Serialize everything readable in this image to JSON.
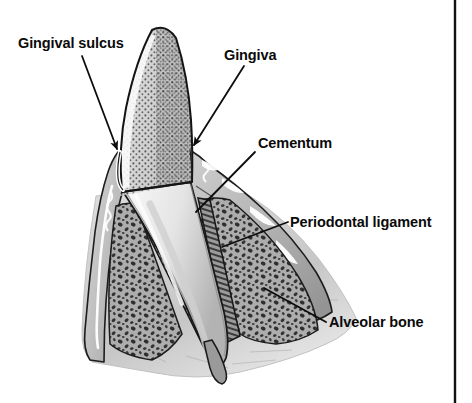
{
  "figure": {
    "kind": "anatomical-illustration",
    "style": "black-and-white line drawing with halftone shading",
    "background_color": "#ffffff",
    "line_color": "#111111",
    "border": {
      "right_rule_color": "#111111",
      "right_rule_x": 455
    }
  },
  "labels": [
    {
      "id": "gingival-sulcus",
      "text": "Gingival sulcus",
      "text_x": 18,
      "text_y": 48,
      "anchor": "start",
      "leader": "M 82 56 L 118 150",
      "arrowhead": {
        "x": 118,
        "y": 151,
        "angle": 70
      }
    },
    {
      "id": "gingiva",
      "text": "Gingiva",
      "text_x": 224,
      "text_y": 60,
      "anchor": "start",
      "leader": "M 244 66 L 193 146",
      "arrowhead": {
        "x": 192,
        "y": 148,
        "angle": 123
      }
    },
    {
      "id": "cementum",
      "text": "Cementum",
      "text_x": 258,
      "text_y": 148,
      "anchor": "start",
      "leader": "M 255 152 L 196 212",
      "arrowhead": null
    },
    {
      "id": "periodontal-ligament",
      "text": "Periodontal ligament",
      "text_x": 290,
      "text_y": 227,
      "anchor": "start",
      "leader": "M 288 222 L 222 247",
      "arrowhead": null
    },
    {
      "id": "alveolar-bone",
      "text": "Alveolar bone",
      "text_x": 329,
      "text_y": 327,
      "anchor": "start",
      "leader": "M 326 322 L 264 288",
      "arrowhead": null
    }
  ],
  "structures": [
    {
      "id": "crown",
      "name": "Tooth crown (enamel)",
      "shading": "stippled halftone",
      "tone": "#c9c9c9"
    },
    {
      "id": "root",
      "name": "Tooth root (dentin)",
      "shading": "smooth light gray",
      "tone": "#e2e2e2"
    },
    {
      "id": "gingiva-left",
      "name": "Left gingival flap",
      "tone": "#b9b9b9"
    },
    {
      "id": "gingiva-right",
      "name": "Right gingival flap",
      "tone": "#bdbdbd"
    },
    {
      "id": "alveolar-bone-left",
      "name": "Left alveolar bone (trabecular)",
      "tone": "#a8a8a8"
    },
    {
      "id": "alveolar-bone-right",
      "name": "Right alveolar bone (trabecular)",
      "tone": "#a8a8a8"
    },
    {
      "id": "periodontal-ligament-band",
      "name": "Periodontal ligament space",
      "tone": "#8f8f8f"
    },
    {
      "id": "cementum-layer",
      "name": "Cementum layer on root surface",
      "tone": "#9a9a9a"
    },
    {
      "id": "sulcus",
      "name": "Gingival sulcus groove",
      "tone": "#ffffff"
    }
  ]
}
